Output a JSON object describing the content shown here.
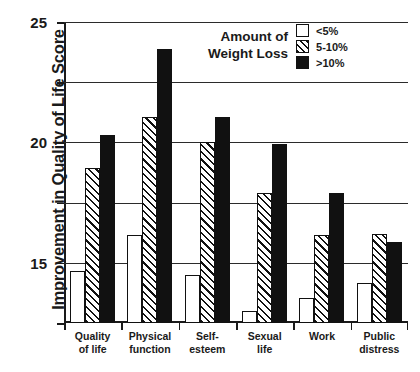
{
  "chart_data": {
    "type": "bar",
    "title": "",
    "xlabel": "",
    "ylabel": "Improvement in Quality of Life Score",
    "ylim": [
      0,
      25
    ],
    "yticks": [
      0,
      5,
      10,
      15,
      20,
      25
    ],
    "grid": true,
    "legend_position": "top-right",
    "legend_title": [
      "Amount of",
      "Weight Loss"
    ],
    "categories": [
      [
        "Quality",
        "of life"
      ],
      [
        "Physical",
        "function"
      ],
      [
        "Self-",
        "esteem"
      ],
      [
        "Sexual",
        "life"
      ],
      [
        "Work"
      ],
      [
        "Public",
        "distress"
      ]
    ],
    "series": [
      {
        "name": "<5%",
        "pattern": "open",
        "color": "#ffffff",
        "values": [
          4.3,
          7.3,
          4.0,
          1.0,
          2.1,
          3.3
        ]
      },
      {
        "name": "5-10%",
        "pattern": "hatch",
        "color": "#ffffff",
        "values": [
          12.9,
          17.1,
          15.0,
          10.8,
          7.3,
          7.4
        ]
      },
      {
        "name": ">10%",
        "pattern": "solid",
        "color": "#111111",
        "values": [
          15.6,
          22.8,
          17.1,
          14.9,
          10.8,
          6.7
        ]
      }
    ]
  },
  "colors": {
    "axis": "#1a1a1a",
    "grid": "#2b2b2b",
    "ink": "#111111",
    "background": "#ffffff"
  }
}
